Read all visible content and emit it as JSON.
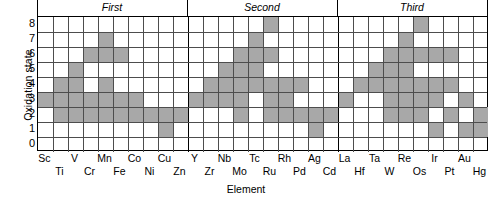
{
  "chart_data": {
    "type": "heatmap",
    "title": "",
    "xlabel": "Element",
    "ylabel": "Oxidation state",
    "ylim": [
      0,
      9
    ],
    "yticks": [
      8,
      7,
      6,
      5,
      4,
      3,
      2,
      1,
      0
    ],
    "grid": true,
    "legend": "none",
    "cell_color": "#a8a8a8",
    "series_headers": [
      {
        "label": "First",
        "start": 0,
        "end": 10
      },
      {
        "label": "Second",
        "start": 10,
        "end": 20
      },
      {
        "label": "Third",
        "start": 20,
        "end": 30
      }
    ],
    "categories": [
      "Sc",
      "Ti",
      "V",
      "Cr",
      "Mn",
      "Fe",
      "Co",
      "Ni",
      "Cu",
      "Zn",
      "Y",
      "Zr",
      "Nb",
      "Mo",
      "Tc",
      "Ru",
      "Rh",
      "Pd",
      "Ag",
      "Cd",
      "La",
      "Hf",
      "Ta",
      "W",
      "Re",
      "Os",
      "Ir",
      "Pt",
      "Au",
      "Hg"
    ],
    "oxidation_states": [
      {
        "element": "Sc",
        "states": [
          3
        ]
      },
      {
        "element": "Ti",
        "states": [
          2,
          3,
          4
        ]
      },
      {
        "element": "V",
        "states": [
          2,
          3,
          4,
          5
        ]
      },
      {
        "element": "Cr",
        "states": [
          2,
          3,
          6
        ]
      },
      {
        "element": "Mn",
        "states": [
          2,
          3,
          4,
          6,
          7
        ]
      },
      {
        "element": "Fe",
        "states": [
          2,
          3,
          6
        ]
      },
      {
        "element": "Co",
        "states": [
          2,
          3
        ]
      },
      {
        "element": "Ni",
        "states": [
          2
        ]
      },
      {
        "element": "Cu",
        "states": [
          1,
          2
        ]
      },
      {
        "element": "Zn",
        "states": [
          2
        ]
      },
      {
        "element": "Y",
        "states": [
          3
        ]
      },
      {
        "element": "Zr",
        "states": [
          3,
          4
        ]
      },
      {
        "element": "Nb",
        "states": [
          3,
          4,
          5
        ]
      },
      {
        "element": "Mo",
        "states": [
          2,
          3,
          4,
          5,
          6
        ]
      },
      {
        "element": "Tc",
        "states": [
          4,
          5,
          6,
          7
        ]
      },
      {
        "element": "Ru",
        "states": [
          2,
          3,
          4,
          6,
          8
        ]
      },
      {
        "element": "Rh",
        "states": [
          2,
          3,
          4
        ]
      },
      {
        "element": "Pd",
        "states": [
          2,
          4
        ]
      },
      {
        "element": "Ag",
        "states": [
          1,
          2
        ]
      },
      {
        "element": "Cd",
        "states": [
          2
        ]
      },
      {
        "element": "La",
        "states": [
          3
        ]
      },
      {
        "element": "Hf",
        "states": [
          4
        ]
      },
      {
        "element": "Ta",
        "states": [
          4,
          5
        ]
      },
      {
        "element": "W",
        "states": [
          2,
          3,
          4,
          5,
          6
        ]
      },
      {
        "element": "Re",
        "states": [
          2,
          3,
          4,
          5,
          6,
          7
        ]
      },
      {
        "element": "Os",
        "states": [
          2,
          3,
          4,
          6,
          8
        ]
      },
      {
        "element": "Ir",
        "states": [
          1,
          3,
          4,
          6
        ]
      },
      {
        "element": "Pt",
        "states": [
          2,
          4,
          6
        ]
      },
      {
        "element": "Au",
        "states": [
          1,
          3
        ]
      },
      {
        "element": "Hg",
        "states": [
          1,
          2
        ]
      }
    ]
  }
}
